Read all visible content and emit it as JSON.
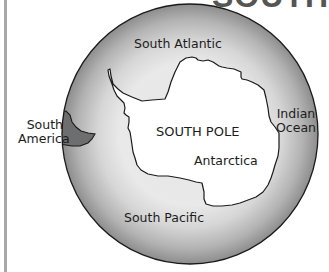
{
  "title": {
    "partial_text": "SOUTH"
  },
  "map": {
    "type": "polar projection",
    "colors": {
      "ocean_dark": "#8a8a8a",
      "ocean_light": "#e2e2e2",
      "land_antarctica": "#ffffff",
      "land_south_america": "#6e6e6e",
      "outline": "#1a1a1a",
      "page_border": "#a8a8a8"
    },
    "labels": {
      "south_atlantic": "South Atlantic",
      "south_america_line1": "South",
      "south_america_line2": "America",
      "south_pole": "SOUTH POLE",
      "antarctica": "Antarctica",
      "indian_ocean_line1": "Indian",
      "indian_ocean_line2": "Ocean",
      "south_pacific": "South Pacific"
    }
  }
}
